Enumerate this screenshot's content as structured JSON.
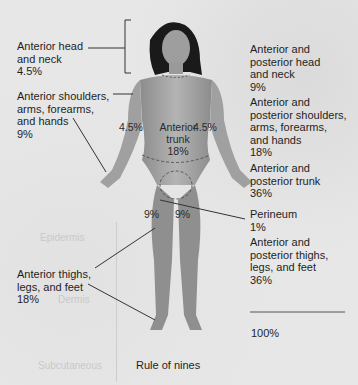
{
  "diagram": {
    "title": "Rule of nines",
    "left_labels": [
      {
        "text": "Anterior head\nand neck\n4.5%"
      },
      {
        "text": "Anterior shoulders,\narms, forearms,\nand hands\n9%"
      },
      {
        "text": "Anterior thighs,\nlegs, and feet\n18%"
      }
    ],
    "right_labels": [
      {
        "text": "Anterior and\nposterior head\nand neck\n9%"
      },
      {
        "text": "Anterior and\nposterior shoulders,\narms, forearms,\nand hands\n18%"
      },
      {
        "text": "Anterior and\nposterior trunk\n36%"
      },
      {
        "text": "Perineum\n1%"
      },
      {
        "text": "Anterior and\nposterior thighs,\nlegs, and feet\n36%"
      }
    ],
    "total": "100%",
    "body_labels": {
      "left_arm": "4.5%",
      "right_arm": "4.5%",
      "trunk": "Anterior\ntrunk\n18%",
      "left_thigh": "9%",
      "right_thigh": "9%"
    },
    "ghost_text": [
      "Epidermis",
      "Dermis",
      "Subcutaneous"
    ]
  },
  "colors": {
    "paper": "#e7e7e7",
    "text": "#1e1e1e",
    "skin": "#a8a8a8",
    "hair": "#1a1a1a"
  }
}
